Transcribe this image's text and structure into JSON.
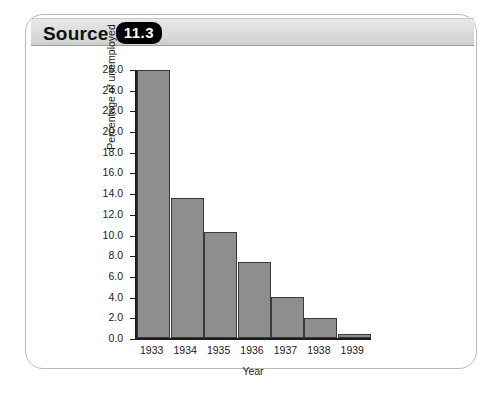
{
  "header": {
    "title": "Source",
    "badge": "11.3"
  },
  "chart_data": {
    "type": "bar",
    "title": "",
    "subtitle": "",
    "xlabel": "Year",
    "ylabel": "Percentage of unemployed",
    "categories": [
      "1933",
      "1934",
      "1935",
      "1936",
      "1937",
      "1938",
      "1939"
    ],
    "values": [
      25.9,
      13.5,
      10.2,
      7.3,
      4.0,
      1.9,
      0.4
    ],
    "ylim": [
      0.0,
      26.0
    ],
    "ytick_labels": [
      "26.0",
      "24.0",
      "22.0",
      "20.0",
      "18.0",
      "16.0",
      "14.0",
      "12.0",
      "10.0",
      "8.0",
      "6.0",
      "4.0",
      "2.0",
      "0.0"
    ],
    "ytick_values": [
      26.0,
      24.0,
      22.0,
      20.0,
      18.0,
      16.0,
      14.0,
      12.0,
      10.0,
      8.0,
      6.0,
      4.0,
      2.0,
      0.0
    ],
    "grid": false,
    "legend": null,
    "bar_color": "#8e8e8e",
    "bar_border_color": "#3a3a3a",
    "axis_color": "#1c1c1c"
  }
}
